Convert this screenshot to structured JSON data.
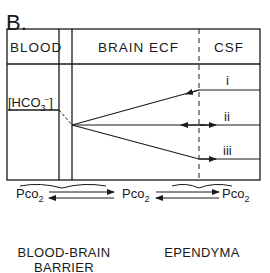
{
  "panel_label": "B.",
  "columns": {
    "blood": "BLOOD",
    "brain_ecf": "BRAIN ECF",
    "csf": "CSF"
  },
  "bicarbonate": {
    "open": "[HCO",
    "sub": "3",
    "sup": "−",
    "close": "]"
  },
  "pathways": [
    "i",
    "ii",
    "iii"
  ],
  "pco2": {
    "blood": {
      "base": "Pco",
      "sub": "2"
    },
    "brain": {
      "base": "Pco",
      "sub": "2"
    },
    "csf": {
      "base": "Pco",
      "sub": "2"
    }
  },
  "captions": {
    "blood_brain_barrier_line1": "BLOOD-BRAIN",
    "blood_brain_barrier_line2": "BARRIER",
    "ependyma": "EPENDYMA"
  },
  "colors": {
    "line": "#1a1a1a",
    "background": "#ffffff"
  }
}
